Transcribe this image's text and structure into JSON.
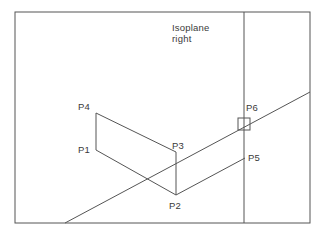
{
  "canvas": {
    "width": 324,
    "height": 234,
    "background": "#ffffff",
    "line_color": "#555555",
    "text_color": "#3a3a3a"
  },
  "frame": {
    "x": 15,
    "y": 12,
    "width": 295,
    "height": 211
  },
  "title": {
    "line1": "Isoplane",
    "line2": "right",
    "x": 172,
    "y1": 31,
    "y2": 42
  },
  "divider": {
    "label": "isoplane-divider",
    "x": 244,
    "y_top": 12,
    "y_bottom": 223
  },
  "lines": {
    "main_diagonal": {
      "x1": 65,
      "y1": 223,
      "x2": 310,
      "y2": 92
    },
    "lower_parallel": {
      "x1": 176,
      "y1": 195,
      "x2": 245,
      "y2": 158
    }
  },
  "shape": {
    "name": "isometric-face",
    "edges": [
      {
        "name": "edge-p4-p3",
        "x1": 96,
        "y1": 113,
        "x2": 176,
        "y2": 152
      },
      {
        "name": "edge-p1-p2",
        "x1": 96,
        "y1": 150,
        "x2": 176,
        "y2": 195
      },
      {
        "name": "edge-p4-p1",
        "x1": 96,
        "y1": 113,
        "x2": 96,
        "y2": 150
      },
      {
        "name": "edge-p3-p2",
        "x1": 176,
        "y1": 152,
        "x2": 176,
        "y2": 195
      }
    ]
  },
  "points": [
    {
      "id": "P1",
      "label": "P1",
      "x": 96,
      "y": 150,
      "label_x": 78,
      "label_y": 153
    },
    {
      "id": "P2",
      "label": "P2",
      "x": 176,
      "y": 195,
      "label_x": 169,
      "label_y": 209
    },
    {
      "id": "P3",
      "label": "P3",
      "x": 176,
      "y": 152,
      "label_x": 172,
      "label_y": 149
    },
    {
      "id": "P4",
      "label": "P4",
      "x": 96,
      "y": 113,
      "label_x": 78,
      "label_y": 110
    },
    {
      "id": "P5",
      "label": "P5",
      "x": 245,
      "y": 158,
      "label_x": 248,
      "label_y": 161
    },
    {
      "id": "P6",
      "label": "P6",
      "x": 244,
      "y": 124,
      "label_x": 246,
      "label_y": 111
    }
  ],
  "marker": {
    "name": "p6-snap-marker",
    "x": 238,
    "y": 118,
    "size": 12
  }
}
